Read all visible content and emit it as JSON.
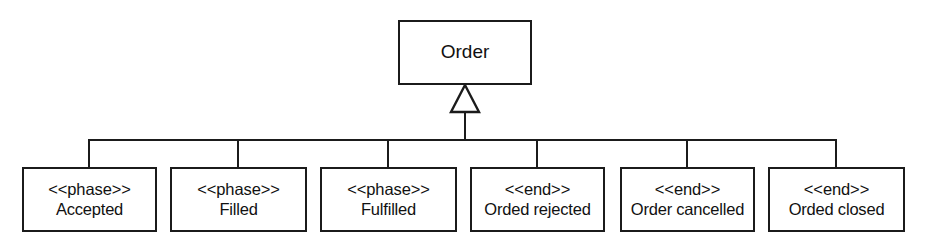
{
  "diagram": {
    "type": "uml-class-generalization",
    "notation": "UML generalization (hollow triangle) with shared tree connector",
    "background_color": "#ffffff",
    "line_color": "#1b1b1b",
    "text_color": "#111111",
    "root": {
      "name": "Order",
      "x": 398,
      "y": 20,
      "width": 134,
      "height": 65
    },
    "connector": {
      "triangle_apex_x": 465,
      "triangle_apex_y": 85,
      "triangle_base_y": 112,
      "triangle_half_width": 14,
      "stem_from_y": 112,
      "stem_to_y": 140,
      "bus_y": 140,
      "bus_x_start": 89,
      "bus_x_end": 836,
      "drop_to_y": 167
    },
    "subclasses": [
      {
        "stereotype": "<<phase>>",
        "name": "Accepted",
        "x": 22,
        "y": 167,
        "width": 135,
        "height": 65,
        "center_x": 89
      },
      {
        "stereotype": "<<phase>>",
        "name": "Filled",
        "x": 170,
        "y": 167,
        "width": 137,
        "height": 65,
        "center_x": 238
      },
      {
        "stereotype": "<<phase>>",
        "name": "Fulfilled",
        "x": 320,
        "y": 167,
        "width": 137,
        "height": 65,
        "center_x": 388
      },
      {
        "stereotype": "<<end>>",
        "name": "Orded rejected",
        "x": 470,
        "y": 167,
        "width": 135,
        "height": 65,
        "center_x": 537
      },
      {
        "stereotype": "<<end>>",
        "name": "Order cancelled",
        "x": 620,
        "y": 167,
        "width": 135,
        "height": 65,
        "center_x": 687
      },
      {
        "stereotype": "<<end>>",
        "name": "Orded closed",
        "x": 768,
        "y": 167,
        "width": 137,
        "height": 65,
        "center_x": 836
      }
    ]
  }
}
